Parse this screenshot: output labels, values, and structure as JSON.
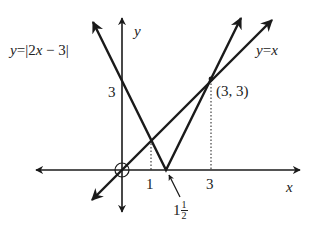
{
  "figure": {
    "type": "function-graph",
    "axes": {
      "x_label": "x",
      "y_label": "y"
    },
    "curves": [
      {
        "label": "y=|2x − 3|",
        "vertex": [
          1.5,
          0
        ],
        "color": "#1a1a1a"
      },
      {
        "label": "y=x",
        "color": "#1a1a1a"
      }
    ],
    "ticks": {
      "x": [
        "1",
        "3"
      ],
      "y": [
        "3"
      ]
    },
    "intersection_point": {
      "label": "(3, 3)",
      "x": 3,
      "y": 3
    },
    "vertex_label": {
      "whole": "1",
      "num": "1",
      "den": "2"
    },
    "origin_marker": "circle"
  },
  "labels": {
    "abs_curve": "y = |2x − 3|",
    "identity_curve": "y = x",
    "point": "(3, 3)",
    "x_axis": "x",
    "y_axis": "y",
    "x_tick_1": "1",
    "x_tick_3": "3",
    "y_tick_3": "3",
    "vertex_whole": "1",
    "vertex_num": "1",
    "vertex_den": "2"
  }
}
